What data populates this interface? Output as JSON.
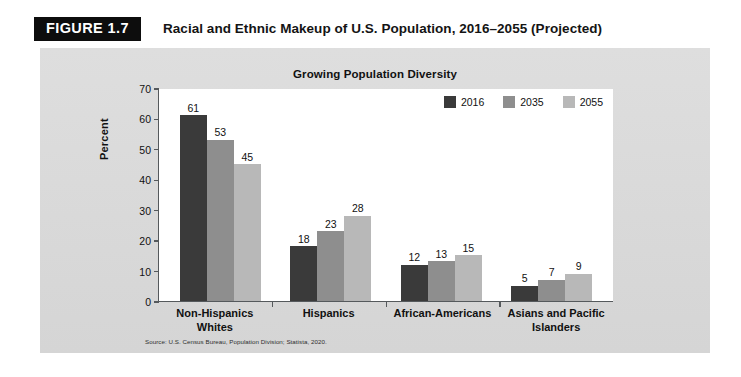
{
  "figure": {
    "badge": "FIGURE 1.7",
    "title": "Racial and Ethnic Makeup of U.S. Population, 2016–2055 (Projected)"
  },
  "source_note": "Source: U.S. Census Bureau, Population Division; Statista, 2020.",
  "colors": {
    "series_2016": "#3a3a3a",
    "series_2035": "#8e8e8e",
    "series_2055": "#b8b8b8",
    "panel_bg": "#dcdcdc",
    "plot_bg": "#ffffff",
    "axis": "#55595c",
    "badge_bg": "#0d0d0d"
  },
  "chart_data": {
    "type": "bar",
    "title": "Growing Population Diversity",
    "xlabel": "",
    "ylabel": "Percent",
    "ylim": [
      0,
      70
    ],
    "yticks": [
      0,
      10,
      20,
      30,
      40,
      50,
      60,
      70
    ],
    "grid": false,
    "legend_position": "top-right",
    "categories": [
      "Non-Hispanics\nWhites",
      "Hispanics",
      "African-Americans",
      "Asians and Pacific\nIslanders"
    ],
    "category_lines": [
      [
        "Non-Hispanics",
        "Whites"
      ],
      [
        "Hispanics",
        ""
      ],
      [
        "African-Americans",
        ""
      ],
      [
        "Asians and Pacific",
        "Islanders"
      ]
    ],
    "series": [
      {
        "name": "2016",
        "color": "#3a3a3a",
        "values": [
          61,
          18,
          12,
          5
        ]
      },
      {
        "name": "2035",
        "color": "#8e8e8e",
        "values": [
          53,
          23,
          13,
          7
        ]
      },
      {
        "name": "2055",
        "color": "#b8b8b8",
        "values": [
          45,
          28,
          15,
          9
        ]
      }
    ]
  }
}
